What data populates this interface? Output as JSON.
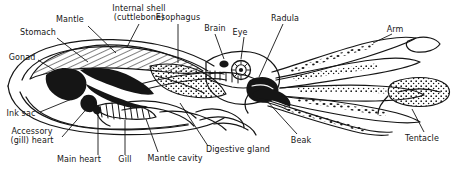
{
  "figure": {
    "type": "labeled-anatomical-diagram",
    "organism": "cuttlefish / squid (Cephalopoda)",
    "background_color": "#ffffff",
    "ink_color": "#151515",
    "width": 454,
    "height": 178
  },
  "labels": [
    {
      "id": "mantle",
      "text": "Mantle",
      "x": 70,
      "y": 15,
      "align": "ctr",
      "leader": [
        [
          88,
          26
        ],
        [
          116,
          53
        ]
      ]
    },
    {
      "id": "internal-shell",
      "text": "Internal shell\n(cuttlebone)",
      "x": 139,
      "y": 5,
      "align": "ctr",
      "leader": [
        [
          139,
          24
        ],
        [
          127,
          47
        ]
      ]
    },
    {
      "id": "esophagus",
      "text": "Esophagus",
      "x": 178,
      "y": 14,
      "align": "ctr",
      "leader": [
        [
          178,
          24
        ],
        [
          178,
          63
        ]
      ]
    },
    {
      "id": "stomach",
      "text": "Stomach",
      "x": 37,
      "y": 29,
      "align": "ctr",
      "leader": [
        [
          57,
          38
        ],
        [
          88,
          62
        ]
      ]
    },
    {
      "id": "gonad",
      "text": "Gonad",
      "x": 21,
      "y": 54,
      "align": "ctr",
      "leader": [
        [
          38,
          60
        ],
        [
          67,
          78
        ]
      ]
    },
    {
      "id": "brain",
      "text": "Brain",
      "x": 215,
      "y": 25,
      "align": "ctr",
      "leader": [
        [
          215,
          34
        ],
        [
          224,
          59
        ]
      ]
    },
    {
      "id": "eye",
      "text": "Eye",
      "x": 240,
      "y": 28,
      "align": "ctr",
      "leader": [
        [
          244,
          37
        ],
        [
          241,
          59
        ]
      ]
    },
    {
      "id": "radula",
      "text": "Radula",
      "x": 285,
      "y": 15,
      "align": "ctr",
      "leader": [
        [
          283,
          24
        ],
        [
          259,
          77
        ]
      ]
    },
    {
      "id": "arm",
      "text": "Arm",
      "x": 395,
      "y": 26,
      "align": "ctr",
      "leader": [
        [
          392,
          34
        ],
        [
          373,
          43
        ]
      ]
    },
    {
      "id": "ink-sac",
      "text": "Ink sac",
      "x": 20,
      "y": 110,
      "align": "ctr",
      "leader": [
        [
          40,
          112
        ],
        [
          79,
          96
        ]
      ]
    },
    {
      "id": "accessory-heart",
      "text": "Accessory\n(gill) heart",
      "x": 31,
      "y": 131,
      "align": "ctr",
      "leader": [
        [
          62,
          137
        ],
        [
          90,
          105
        ]
      ]
    },
    {
      "id": "main-heart",
      "text": "Main heart",
      "x": 78,
      "y": 157,
      "align": "ctr",
      "leader": [
        [
          98,
          155
        ],
        [
          98,
          117
        ]
      ]
    },
    {
      "id": "gill",
      "text": "Gill",
      "x": 125,
      "y": 157,
      "align": "ctr",
      "leader": [
        [
          125,
          155
        ],
        [
          125,
          120
        ]
      ]
    },
    {
      "id": "mantle-cavity",
      "text": "Mantle cavity",
      "x": 171,
      "y": 157,
      "align": "ctr",
      "leader": [
        [
          158,
          152
        ],
        [
          146,
          119
        ]
      ]
    },
    {
      "id": "digestive-gland",
      "text": "Digestive gland",
      "x": 237,
      "y": 147,
      "align": "ctr",
      "leader": [
        [
          208,
          146
        ],
        [
          180,
          103
        ]
      ]
    },
    {
      "id": "beak",
      "text": "Beak",
      "x": 300,
      "y": 137,
      "align": "ctr",
      "leader": [
        [
          297,
          134
        ],
        [
          267,
          101
        ]
      ]
    },
    {
      "id": "tentacle",
      "text": "Tentacle",
      "x": 421,
      "y": 135,
      "align": "ctr",
      "leader": [
        [
          424,
          132
        ],
        [
          412,
          109
        ]
      ]
    }
  ]
}
